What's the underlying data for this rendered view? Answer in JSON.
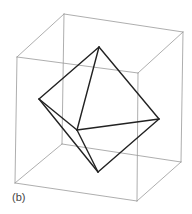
{
  "figure": {
    "label": "(b)",
    "label_pos": [
      12,
      191
    ],
    "cube": {
      "color": "#999999",
      "vertices": {
        "FTL": [
          17,
          57
        ],
        "FTR": [
          138,
          73
        ],
        "FBL": [
          15,
          183
        ],
        "FBR": [
          137,
          201
        ],
        "BTL": [
          64,
          14
        ],
        "BTR": [
          183,
          32
        ],
        "BBL": [
          62,
          144
        ],
        "BBR": [
          181,
          162
        ]
      },
      "edges": [
        [
          "FTL",
          "FTR"
        ],
        [
          "FTR",
          "FBR"
        ],
        [
          "FBR",
          "FBL"
        ],
        [
          "FBL",
          "FTL"
        ],
        [
          "BTL",
          "BTR"
        ],
        [
          "BTR",
          "BBR"
        ],
        [
          "BBR",
          "BBL"
        ],
        [
          "BBL",
          "BTL"
        ],
        [
          "FTL",
          "BTL"
        ],
        [
          "FTR",
          "BTR"
        ],
        [
          "FBR",
          "BBR"
        ],
        [
          "FBL",
          "BBL"
        ]
      ]
    },
    "octahedron": {
      "color": "#222222",
      "vertices": {
        "top": [
          99,
          47
        ],
        "left": [
          39,
          99
        ],
        "right": [
          159,
          119
        ],
        "bottom": [
          98,
          172
        ],
        "front": [
          77,
          130
        ]
      },
      "edges": [
        [
          "top",
          "left"
        ],
        [
          "top",
          "right"
        ],
        [
          "top",
          "front"
        ],
        [
          "left",
          "front"
        ],
        [
          "left",
          "bottom"
        ],
        [
          "front",
          "right"
        ],
        [
          "front",
          "bottom"
        ],
        [
          "right",
          "bottom"
        ]
      ]
    }
  }
}
